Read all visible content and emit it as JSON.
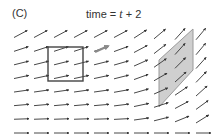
{
  "panel": {
    "label": "(C)",
    "title_prefix": "time = ",
    "title_var": "t",
    "title_suffix": " + 2"
  },
  "colors": {
    "arrow": "#333333",
    "highlight_arrow": "#8a8a8a",
    "square_stroke": "#444444",
    "parallelogram_fill": "#cfcfcf",
    "parallelogram_stroke": "#9a9a9a"
  },
  "field": {
    "columns_x": [
      14,
      34,
      54,
      74,
      94,
      114,
      134,
      154,
      175,
      196
    ],
    "rows_y": [
      34,
      49,
      63,
      77,
      91,
      105,
      119,
      133
    ],
    "arrow_length": 15,
    "angles_deg": [
      [
        28,
        28,
        28,
        28,
        28,
        28,
        33,
        40,
        48,
        50
      ],
      [
        18,
        18,
        18,
        18,
        18,
        20,
        28,
        38,
        48,
        50
      ],
      [
        14,
        14,
        14,
        14,
        14,
        16,
        24,
        35,
        45,
        48
      ],
      [
        12,
        12,
        12,
        12,
        12,
        14,
        20,
        30,
        42,
        46
      ],
      [
        8,
        8,
        8,
        8,
        8,
        10,
        16,
        24,
        34,
        42
      ],
      [
        5,
        5,
        5,
        5,
        5,
        7,
        12,
        18,
        28,
        36
      ],
      [
        2,
        2,
        2,
        2,
        2,
        3,
        8,
        14,
        22,
        32
      ],
      [
        0,
        0,
        0,
        0,
        0,
        0,
        0,
        0,
        0,
        0
      ]
    ]
  },
  "square": {
    "x": 48,
    "y": 47,
    "w": 35,
    "h": 34
  },
  "parallelogram": {
    "points": [
      [
        159,
        60
      ],
      [
        193,
        29
      ],
      [
        193,
        70
      ],
      [
        159,
        107
      ]
    ]
  },
  "moving_arrow": {
    "x1": 95,
    "y1": 52,
    "x2": 108,
    "y2": 46
  }
}
